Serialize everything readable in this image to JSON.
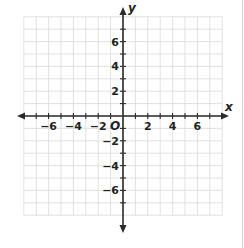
{
  "chart_data": {
    "type": "scatter",
    "title": "",
    "xlabel": "x",
    "ylabel": "y",
    "origin_label": "O",
    "xlim": [
      -8,
      8
    ],
    "ylim": [
      -8,
      8
    ],
    "grid": true,
    "grid_step": 1,
    "x_ticks": [
      -6,
      -4,
      -2,
      2,
      4,
      6
    ],
    "y_ticks": [
      -6,
      -4,
      -2,
      2,
      4,
      6
    ],
    "x_tick_labels": [
      "−6",
      "−4",
      "−2",
      "2",
      "4",
      "6"
    ],
    "y_tick_labels": [
      "−6",
      "−4",
      "−2",
      "2",
      "4",
      "6"
    ],
    "points": [],
    "legend": null
  },
  "colors": {
    "grid": "#d9d9d9",
    "axis": "#2b2b2b",
    "text": "#222222",
    "background": "#ffffff"
  },
  "layout": {
    "origin_px": [
      123,
      116
    ],
    "unit_px": 12.4
  }
}
